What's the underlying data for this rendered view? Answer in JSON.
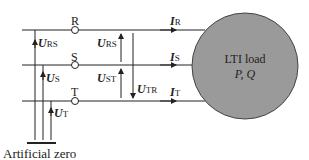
{
  "nodes": {
    "r": "R",
    "s": "S",
    "t": "T"
  },
  "voltages": {
    "u_rs_left": {
      "sym": "U",
      "sub": "RS"
    },
    "u_s": {
      "sym": "U",
      "sub": "S"
    },
    "u_t": {
      "sym": "U",
      "sub": "T"
    },
    "u_rs_right": {
      "sym": "U",
      "sub": "RS"
    },
    "u_st": {
      "sym": "U",
      "sub": "ST"
    },
    "u_tr": {
      "sym": "U",
      "sub": "TR"
    }
  },
  "currents": {
    "i_r": {
      "sym": "I",
      "sub": "R"
    },
    "i_s": {
      "sym": "I",
      "sub": "S"
    },
    "i_t": {
      "sym": "I",
      "sub": "T"
    }
  },
  "load": {
    "title": "LTI load",
    "params": "P, Q",
    "fill": "#9a9a9a"
  },
  "ground_label": "Artificial zero"
}
